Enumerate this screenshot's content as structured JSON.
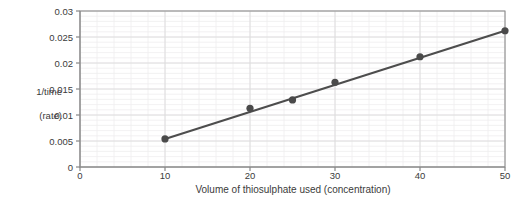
{
  "chart_data": {
    "type": "scatter",
    "title": "",
    "xlabel": "Volume of thiosulphate used (concentration)",
    "ylabel": "1/time\n(rate)",
    "ylabel_line1": "1/time",
    "ylabel_line2": "(rate)",
    "x": [
      10,
      20,
      25,
      30,
      40,
      50
    ],
    "values": [
      0.0054,
      0.0113,
      0.0129,
      0.0163,
      0.0212,
      0.0262
    ],
    "series": [
      {
        "name": "1/time (rate)",
        "x": [
          10,
          20,
          25,
          30,
          40,
          50
        ],
        "values": [
          0.0054,
          0.0113,
          0.0129,
          0.0163,
          0.0212,
          0.0262
        ]
      }
    ],
    "trendline": {
      "type": "linear",
      "x_start": 10,
      "y_start": 0.0054,
      "x_end": 50,
      "y_end": 0.0262
    },
    "xlim": [
      0,
      50
    ],
    "ylim": [
      0,
      0.03
    ],
    "xticks": [
      0,
      10,
      20,
      30,
      40,
      50
    ],
    "yticks": [
      0,
      0.005,
      0.01,
      0.015,
      0.02,
      0.025,
      0.03
    ],
    "xtick_labels": [
      "0",
      "10",
      "20",
      "30",
      "40",
      "50"
    ],
    "ytick_labels": [
      "0",
      "0.005",
      "0.01",
      "0.015",
      "0.02",
      "0.025",
      "0.03"
    ],
    "grid": true,
    "minor_grid": true,
    "legend": "none",
    "colors": {
      "marker": "#4a4a4a",
      "line": "#4d4d4d",
      "major_grid": "#dddbdd",
      "minor_grid": "#efedef",
      "axis": "#8a8a8a",
      "text": "#3b3b3b",
      "background": "#ffffff"
    }
  }
}
